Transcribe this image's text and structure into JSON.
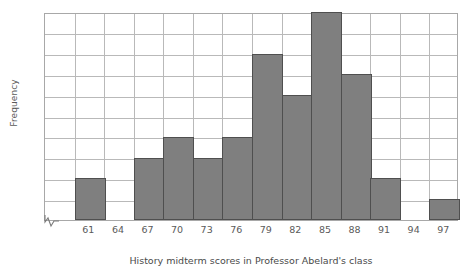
{
  "chart_data": {
    "type": "bar",
    "title": "",
    "xlabel": "History midterm scores in Professor Abelard's class",
    "ylabel": "Frequency",
    "categories": [
      "61",
      "64",
      "67",
      "70",
      "73",
      "76",
      "79",
      "82",
      "85",
      "88",
      "91",
      "94",
      "97"
    ],
    "values": [
      2,
      0,
      3,
      4,
      3,
      4,
      8,
      6,
      10,
      7,
      2,
      0,
      1
    ],
    "xtick_labels": [
      "61",
      "64",
      "67",
      "70",
      "73",
      "76",
      "79",
      "82",
      "85",
      "88",
      "91",
      "94",
      "97"
    ],
    "ytick_labels": [
      "0",
      "1",
      "2",
      "3",
      "4",
      "5",
      "6",
      "7",
      "8",
      "9",
      "10"
    ],
    "ylim": [
      0,
      10
    ],
    "ytick_step": 1,
    "grid": true,
    "legend": "none",
    "bar_color": "#7f7f7f",
    "bar_edge_color": "#4f4f4f",
    "grid_color": "#b9b9b9",
    "axis_color": "#a8a8a8",
    "text_color": "#5a5a5a",
    "has_axis_break": true,
    "axis_break_icon": "axis-break-squiggle",
    "bin_width": 3,
    "n_observations": 50
  }
}
